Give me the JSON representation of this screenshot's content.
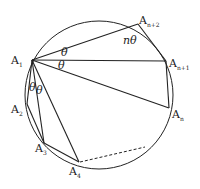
{
  "diagram": {
    "type": "inscribed-polygon-in-circle",
    "circle": {
      "cx": 99,
      "cy": 95,
      "r": 74
    },
    "stroke_color": "#222222",
    "points": [
      {
        "id": "A1",
        "main": "A",
        "sub": "1",
        "x": 32,
        "y": 60
      },
      {
        "id": "A2",
        "main": "A",
        "sub": "2",
        "x": 27,
        "y": 104
      },
      {
        "id": "A3",
        "main": "A",
        "sub": "3",
        "x": 44,
        "y": 143
      },
      {
        "id": "A4",
        "main": "A",
        "sub": "4",
        "x": 79,
        "y": 162
      },
      {
        "id": "An",
        "main": "A",
        "sub": "n",
        "x": 169,
        "y": 108
      },
      {
        "id": "An1",
        "main": "A",
        "sub": "n+1",
        "x": 166,
        "y": 61
      },
      {
        "id": "An2",
        "main": "A",
        "sub": "n+2",
        "x": 138,
        "y": 24
      }
    ],
    "labels": {
      "a1": {
        "main": "A",
        "sub": "1"
      },
      "a2": {
        "main": "A",
        "sub": "2"
      },
      "a3": {
        "main": "A",
        "sub": "3"
      },
      "a4": {
        "main": "A",
        "sub": "4"
      },
      "an": {
        "main": "A",
        "sub": "n"
      },
      "an1": {
        "main": "A",
        "sub": "n+1"
      },
      "an2": {
        "main": "A",
        "sub": "n+2"
      }
    },
    "angles": {
      "theta_top": "θ",
      "theta_mid": "θ",
      "theta_left1": "θ",
      "theta_left2": "θ",
      "n_theta": "nθ"
    },
    "dashed_segment": {
      "from": "A4",
      "to_x": 145,
      "to_y": 147
    }
  }
}
